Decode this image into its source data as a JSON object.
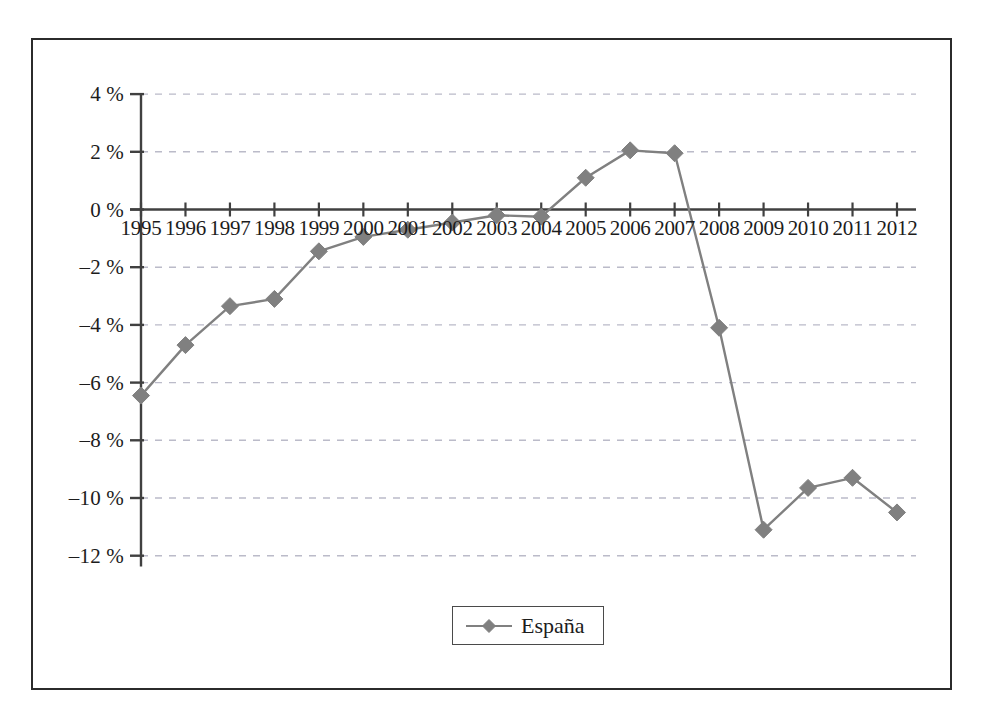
{
  "chart_data": {
    "type": "line",
    "title": "",
    "subtitle": "",
    "xlabel": "",
    "ylabel": "",
    "categories": [
      "1995",
      "1996",
      "1997",
      "1998",
      "1999",
      "2000",
      "2001",
      "2002",
      "2003",
      "2004",
      "2005",
      "2006",
      "2007",
      "2008",
      "2009",
      "2010",
      "2011",
      "2012"
    ],
    "x_tick_labels": [
      "1995",
      "1996",
      "1997",
      "1998",
      "1999",
      "2000",
      "2001",
      "2002",
      "2003",
      "2004",
      "2005",
      "2006",
      "2007",
      "2008",
      "2009",
      "2010",
      "2011",
      "2012"
    ],
    "y_tick_labels": [
      "4 %",
      "2 %",
      "0 %",
      "–2 %",
      "–4 %",
      "–6 %",
      "–8 %",
      "–10 %",
      "–12 %"
    ],
    "y_tick_values": [
      4,
      2,
      0,
      -2,
      -4,
      -6,
      -8,
      -10,
      -12
    ],
    "ylim": [
      -13,
      4
    ],
    "xlim": [
      "1995",
      "2012"
    ],
    "grid": true,
    "grid_style": "dashed-horizontal",
    "legend_position": "bottom-center",
    "series": [
      {
        "name": "España",
        "color": "#808080",
        "marker": "diamond",
        "values": [
          -6.45,
          -4.7,
          -3.35,
          -3.1,
          -1.45,
          -0.95,
          -0.7,
          -0.45,
          -0.2,
          -0.25,
          1.1,
          2.05,
          1.95,
          -4.1,
          -11.1,
          -9.65,
          -9.3,
          -10.5
        ]
      }
    ]
  },
  "legend": {
    "entries": [
      {
        "label": "España",
        "color": "#808080"
      }
    ]
  },
  "style": {
    "axis_color": "#404040",
    "grid_color": "#b0b0c0",
    "frame_color": "#2b2b2b",
    "text_color": "#1c1c1c",
    "background": "#ffffff"
  }
}
